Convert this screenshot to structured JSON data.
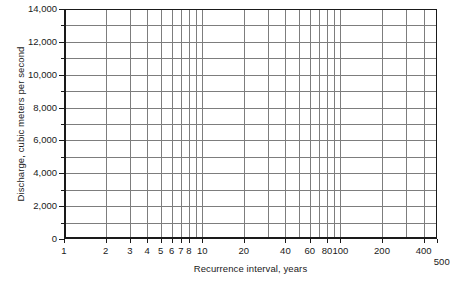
{
  "chart_data": {
    "type": "line",
    "title": "",
    "subtitle": "",
    "xlabel": "Recurrence interval, years",
    "ylabel": "Discharge, cubic meters per second",
    "xscale": "log",
    "yscale": "linear",
    "xlim": [
      1,
      500
    ],
    "ylim": [
      0,
      14000
    ],
    "grid": true,
    "legend": false,
    "legend_position": "none",
    "series": [],
    "annotations": [],
    "x_major_ticks": [
      1,
      2,
      3,
      4,
      5,
      6,
      7,
      8,
      10,
      20,
      40,
      60,
      80,
      100,
      200,
      400,
      500
    ],
    "x_tick_labels": [
      "1",
      "2",
      "3",
      "4",
      "5",
      "6",
      "7",
      "8",
      "10",
      "20",
      "40",
      "60",
      "80",
      "100",
      "200",
      "400",
      "500"
    ],
    "x_gridlines": [
      1,
      2,
      3,
      4,
      5,
      6,
      7,
      8,
      9,
      10,
      20,
      30,
      40,
      50,
      60,
      70,
      80,
      90,
      100,
      200,
      300,
      400,
      500
    ],
    "y_major_ticks": [
      0,
      2000,
      4000,
      6000,
      8000,
      10000,
      12000,
      14000
    ],
    "y_tick_labels": [
      "0",
      "2,000",
      "4,000",
      "6,000",
      "8,000",
      "10,000",
      "12,000",
      "14,000"
    ],
    "y_minor_ticks": [
      1000,
      3000,
      5000,
      7000,
      9000,
      11000,
      13000
    ],
    "y_gridlines": [
      1000,
      2000,
      3000,
      4000,
      5000,
      6000,
      7000,
      8000,
      9000,
      10000,
      11000,
      12000,
      13000
    ],
    "y_tick_interval": 2000,
    "y_minor_interval": 1000,
    "colors": {
      "background": "#ffffff",
      "axis": "#1a1a1a",
      "gridline": "#7d7d7d",
      "text": "#1a1a1a"
    }
  },
  "axes": {
    "x_title": "Recurrence interval, years",
    "y_title": "Discharge, cubic meters per second"
  },
  "ticks": {
    "y": [
      {
        "value": 14000,
        "label": "14,000"
      },
      {
        "value": 12000,
        "label": "12,000"
      },
      {
        "value": 10000,
        "label": "10,000"
      },
      {
        "value": 8000,
        "label": "8,000"
      },
      {
        "value": 6000,
        "label": "6,000"
      },
      {
        "value": 4000,
        "label": "4,000"
      },
      {
        "value": 2000,
        "label": "2,000"
      },
      {
        "value": 0,
        "label": "0"
      }
    ],
    "x": [
      {
        "value": 1,
        "label": "1"
      },
      {
        "value": 2,
        "label": "2"
      },
      {
        "value": 3,
        "label": "3"
      },
      {
        "value": 4,
        "label": "4"
      },
      {
        "value": 5,
        "label": "5"
      },
      {
        "value": 6,
        "label": "6"
      },
      {
        "value": 7,
        "label": "7"
      },
      {
        "value": 8,
        "label": "8"
      },
      {
        "value": 10,
        "label": "10"
      },
      {
        "value": 20,
        "label": "20"
      },
      {
        "value": 40,
        "label": "40"
      },
      {
        "value": 60,
        "label": "60"
      },
      {
        "value": 80,
        "label": "80"
      },
      {
        "value": 100,
        "label": "100"
      },
      {
        "value": 200,
        "label": "200"
      },
      {
        "value": 400,
        "label": "400"
      },
      {
        "value": 500,
        "label": "500"
      }
    ]
  }
}
